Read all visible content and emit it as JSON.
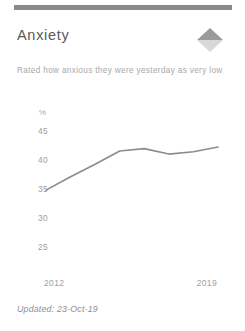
{
  "card": {
    "title": "Anxiety",
    "description": "Rated how anxious they were yesterday as very low",
    "footer": "Updated: 23-Oct-19",
    "trend_icon": "trend-up-diamond-icon",
    "accent_bar_color": "#8a8a8a",
    "title_color": "#58585a",
    "text_color": "#a8a8aa",
    "line_color": "#8c8c8e"
  },
  "chart_data": {
    "type": "line",
    "title": "Anxiety",
    "xlabel": "",
    "ylabel": "%",
    "unit": "%",
    "x": [
      2012,
      2013,
      2014,
      2015,
      2016,
      2017,
      2018,
      2019
    ],
    "categories": [
      "2012",
      "2013",
      "2014",
      "2015",
      "2016",
      "2017",
      "2018",
      "2019"
    ],
    "values": [
      35.5,
      37.2,
      38.8,
      40.5,
      40.8,
      40.1,
      40.4,
      41.0
    ],
    "series": [
      {
        "name": "Rated anxiety as very low",
        "values": [
          35.5,
          37.2,
          38.8,
          40.5,
          40.8,
          40.1,
          40.4,
          41.0
        ]
      }
    ],
    "ylim": [
      23.5,
      46.5
    ],
    "xlim": [
      2012,
      2019
    ],
    "yticks": [
      45,
      40,
      35,
      30,
      25
    ],
    "ytick_labels": [
      "45",
      "40",
      "35",
      "30",
      "25"
    ],
    "xticks": [
      2012,
      2019
    ],
    "xtick_labels": [
      "2012",
      "2019"
    ],
    "grid": false,
    "legend": false
  }
}
